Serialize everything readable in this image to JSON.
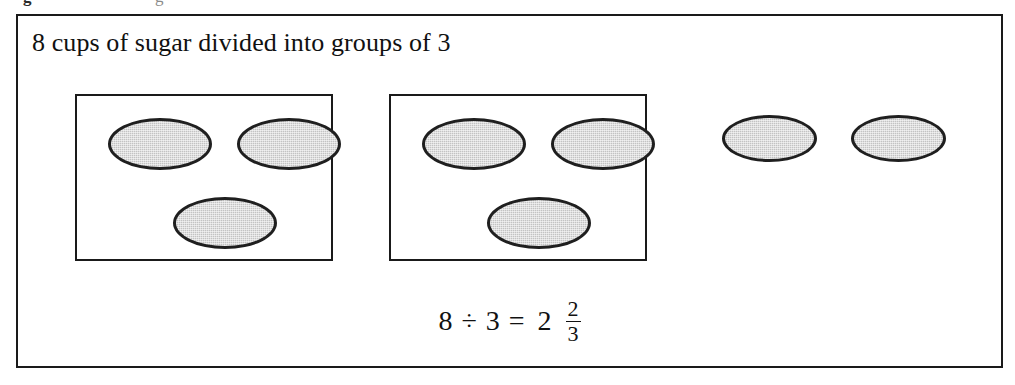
{
  "figure": {
    "title": "8 cups of sugar divided into groups of 3",
    "border_color": "#1a1a1a",
    "background_color": "#ffffff"
  },
  "crop_artifact": {
    "fragment_left": "g",
    "fragment_right": "g"
  },
  "cup": {
    "fill_color": "#c3c3c3",
    "outline_color": "#1f1f1f",
    "label": "cup of sugar"
  },
  "groups": [
    {
      "name": "group-1",
      "boxed": true,
      "cup_count": 3,
      "cups": [
        {
          "name": "cup-1"
        },
        {
          "name": "cup-2"
        },
        {
          "name": "cup-3"
        }
      ]
    },
    {
      "name": "group-2",
      "boxed": true,
      "cup_count": 3,
      "cups": [
        {
          "name": "cup-4"
        },
        {
          "name": "cup-5"
        },
        {
          "name": "cup-6"
        }
      ]
    },
    {
      "name": "remainder",
      "boxed": false,
      "cup_count": 2,
      "cups": [
        {
          "name": "cup-7"
        },
        {
          "name": "cup-8"
        }
      ]
    }
  ],
  "equation": {
    "dividend": "8",
    "divide_symbol": "÷",
    "divisor": "3",
    "equals_symbol": "=",
    "quotient_whole": "2",
    "quotient_numerator": "2",
    "quotient_denominator": "3",
    "full_text": "8 ÷ 3 = 2 2/3"
  },
  "totals": {
    "total_cups": 8,
    "group_size": 3,
    "complete_groups": 2,
    "remainder_cups": 2
  }
}
